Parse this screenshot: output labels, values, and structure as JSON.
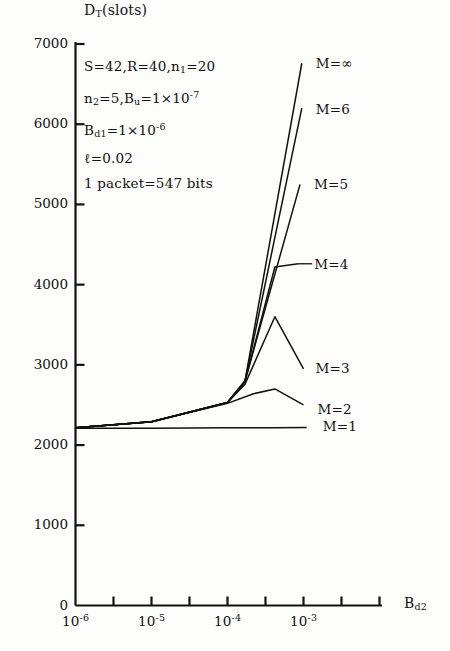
{
  "chart_data": {
    "type": "line",
    "title": "",
    "ylabel": "D_T(slots)",
    "xlabel": "B_d2",
    "xscale": "log",
    "xlim": [
      1e-06,
      0.0022
    ],
    "ylim": [
      0,
      7000
    ],
    "ytick_values": [
      0,
      1000,
      2000,
      3000,
      4000,
      5000,
      6000,
      7000
    ],
    "ytick_labels": [
      "0",
      "1000",
      "2000",
      "3000",
      "4000",
      "5000",
      "6000",
      "7000"
    ],
    "xtick_values": [
      1e-06,
      1e-05,
      0.0001,
      0.001
    ],
    "xtick_labels": [
      "10^-6",
      "10^-5",
      "10^-4",
      "10^-3"
    ],
    "xtick_minor_count": 8,
    "grid": false,
    "legend_position": "inline-right-of-curve-ends",
    "series": [
      {
        "name": "M=1",
        "label": "M=1",
        "x": [
          1e-06,
          1e-05,
          0.0001,
          0.0004,
          0.0011
        ],
        "y": [
          2210,
          2210,
          2215,
          2215,
          2220
        ]
      },
      {
        "name": "M=2",
        "label": "M=2",
        "x": [
          1e-06,
          1e-05,
          0.0001,
          0.00022,
          0.00042,
          0.001
        ],
        "y": [
          2215,
          2290,
          2520,
          2640,
          2700,
          2500
        ]
      },
      {
        "name": "M=3",
        "label": "M=3",
        "x": [
          1e-06,
          1e-05,
          0.0001,
          0.00017,
          0.00042,
          0.001
        ],
        "y": [
          2215,
          2290,
          2530,
          2760,
          3600,
          2950
        ]
      },
      {
        "name": "M=4",
        "label": "M=4",
        "x": [
          1e-06,
          1e-05,
          0.0001,
          0.00017,
          0.00042,
          0.00085
        ],
        "y": [
          2215,
          2290,
          2530,
          2790,
          4220,
          4260
        ]
      },
      {
        "name": "M=5",
        "label": "M=5",
        "x": [
          1e-06,
          1e-05,
          0.0001,
          0.00017,
          0.0009
        ],
        "y": [
          2215,
          2290,
          2530,
          2800,
          5250
        ]
      },
      {
        "name": "M=6",
        "label": "M=6",
        "x": [
          1e-06,
          1e-05,
          0.0001,
          0.00017,
          0.00095
        ],
        "y": [
          2215,
          2290,
          2530,
          2800,
          6200
        ]
      },
      {
        "name": "M=infinity",
        "label": "M=∞",
        "x": [
          1e-06,
          1e-05,
          0.0001,
          0.00017,
          0.00095
        ],
        "y": [
          2215,
          2290,
          2530,
          2800,
          6760
        ]
      }
    ],
    "annotation_lines": [
      "S=42,R=40,n_1=20",
      "n_2=5,B_u=1×10^-7",
      "B_d1=1×10^-6",
      "ℓ=0.02",
      "1 packet=547 bits"
    ]
  },
  "axis": {
    "ylabel_main": "D",
    "ylabel_sub": "T",
    "ylabel_rest": "(slots)",
    "xlabel_main": "B",
    "xlabel_sub": "d2"
  },
  "annotation": {
    "l1_a": "S=42,R=40,n",
    "l1_sub": "1",
    "l1_b": "=20",
    "l2_a": "n",
    "l2_sub1": "2",
    "l2_b": "=5,B",
    "l2_sub2": "u",
    "l2_c": "=1×10",
    "l2_sup": "-7",
    "l3_a": "B",
    "l3_sub": "d1",
    "l3_b": "=1×10",
    "l3_sup": "-6",
    "l4": "ℓ=0.02",
    "l5": "1 packet=547 bits"
  },
  "ticks": {
    "y": [
      "7000",
      "6000",
      "5000",
      "4000",
      "3000",
      "2000",
      "1000",
      "0"
    ],
    "x_mantissa": "10",
    "x_exponents": [
      "-6",
      "-5",
      "-4",
      "-3"
    ]
  },
  "curve_labels": {
    "inf": "M=∞",
    "m6": "M=6",
    "m5": "M=5",
    "m4": "M=4",
    "m3": "M=3",
    "m2": "M=2",
    "m1": "M=1"
  },
  "colors": {
    "ink": "#111111",
    "background": "#fdfdfb"
  }
}
